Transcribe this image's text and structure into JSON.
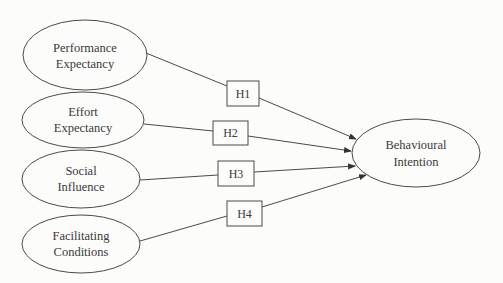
{
  "diagram": {
    "type": "research-model",
    "independent_variables": [
      {
        "id": "pe",
        "line1": "Performance",
        "line2": "Expectancy"
      },
      {
        "id": "ee",
        "line1": "Effort",
        "line2": "Expectancy"
      },
      {
        "id": "si",
        "line1": "Social",
        "line2": "Influence"
      },
      {
        "id": "fc",
        "line1": "Facilitating",
        "line2": "Conditions"
      }
    ],
    "dependent_variable": {
      "id": "bi",
      "line1": "Behavioural",
      "line2": "Intention"
    },
    "hypotheses": [
      {
        "label": "H1",
        "from": "Performance Expectancy",
        "to": "Behavioural Intention"
      },
      {
        "label": "H2",
        "from": "Effort Expectancy",
        "to": "Behavioural Intention"
      },
      {
        "label": "H3",
        "from": "Social Influence",
        "to": "Behavioural Intention"
      },
      {
        "label": "H4",
        "from": "Facilitating Conditions",
        "to": "Behavioural Intention"
      }
    ],
    "colors": {
      "stroke": "#4a4a4a",
      "text": "#3a3a3a",
      "background": "#fcfcfb"
    }
  }
}
